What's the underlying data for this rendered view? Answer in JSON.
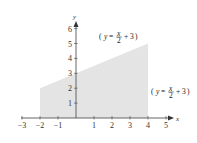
{
  "chart_data": {
    "type": "area",
    "title": "",
    "xlabel": "x",
    "ylabel": "y",
    "xlim": [
      -3,
      5.4
    ],
    "ylim": [
      0,
      6.5
    ],
    "grid": false,
    "legend": "none",
    "x_ticks": [
      -3,
      -2,
      -1,
      1,
      2,
      3,
      4,
      5
    ],
    "y_ticks": [
      1,
      2,
      3,
      4,
      5,
      6
    ],
    "x_tick_labels": [
      "−3",
      "−2",
      "−1",
      "1",
      "2",
      "3",
      "4",
      "5"
    ],
    "y_tick_labels": [
      "1",
      "2",
      "3",
      "4",
      "5",
      "6"
    ],
    "series": [
      {
        "name": "y = x/2 + 3",
        "function": "y = x/2 + 3",
        "x": [
          -2,
          4
        ],
        "values": [
          2,
          5
        ],
        "fill_to": 0,
        "fill_color": "#e4e4e4"
      }
    ],
    "shaded_region": {
      "x_from": -2,
      "x_to": 4,
      "lower": 0,
      "upper": "x/2 + 3",
      "vertices": [
        [
          -2,
          0
        ],
        [
          -2,
          2
        ],
        [
          4,
          5
        ],
        [
          4,
          0
        ]
      ]
    },
    "annotations": [
      {
        "text": "y = x/2 + 3",
        "parts": {
          "lhs": "y",
          "num": "x",
          "den": "2",
          "rest": "+ 3"
        },
        "position": "top-center"
      },
      {
        "text": "y = x/2 + 3",
        "parts": {
          "lhs": "y",
          "num": "x",
          "den": "2",
          "rest": "+ 3"
        },
        "position": "right"
      }
    ]
  },
  "colors": {
    "axis": "#555555",
    "fill": "#e4e4e4",
    "text": "#333333"
  }
}
